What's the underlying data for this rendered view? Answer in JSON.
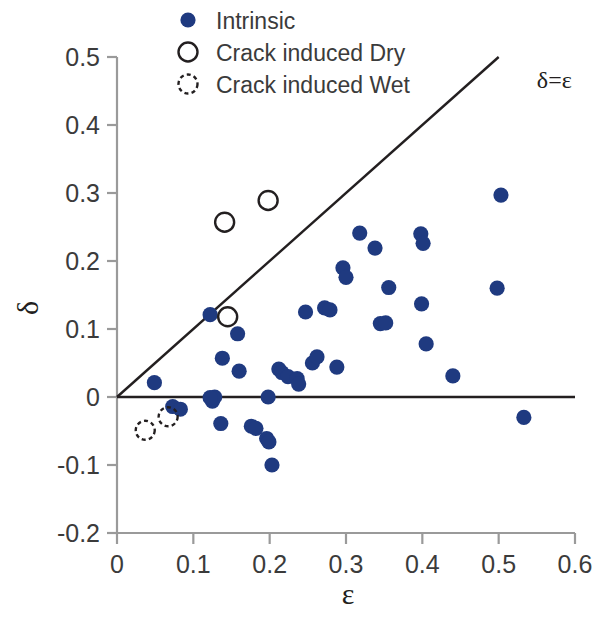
{
  "chart_data": {
    "type": "scatter",
    "title": "",
    "xlabel": "ε",
    "ylabel": "δ",
    "xlim": [
      0,
      0.6
    ],
    "ylim": [
      -0.2,
      0.5
    ],
    "xticks": [
      "0",
      "0.1",
      "0.2",
      "0.3",
      "0.4",
      "0.5",
      "0.6"
    ],
    "yticks": [
      "0.5",
      "0.4",
      "0.3",
      "0.2",
      "0.1",
      "0",
      "-0.1",
      "-0.2"
    ],
    "grid": false,
    "legend_position": "top-center",
    "annotations": [
      {
        "text": "δ=ε",
        "x": 0.55,
        "y": 0.455,
        "描述": "label for identity line"
      }
    ],
    "reference_lines": [
      {
        "name": "identity-line",
        "equation": "delta = epsilon",
        "from": [
          0.0,
          0.0
        ],
        "to": [
          0.5,
          0.5
        ]
      },
      {
        "name": "zero-line",
        "equation": "delta = 0",
        "from": [
          0.0,
          0.0
        ],
        "to": [
          0.6,
          0.0
        ]
      }
    ],
    "series": [
      {
        "name": "Intrinsic",
        "marker": "filled-circle",
        "color": "#1f3a80",
        "points": [
          [
            0.049,
            0.021
          ],
          [
            0.073,
            -0.014
          ],
          [
            0.083,
            -0.018
          ],
          [
            0.122,
            0.121
          ],
          [
            0.125,
            -0.006
          ],
          [
            0.128,
            0.0
          ],
          [
            0.122,
            -0.001
          ],
          [
            0.138,
            0.057
          ],
          [
            0.136,
            -0.039
          ],
          [
            0.158,
            0.093
          ],
          [
            0.16,
            0.038
          ],
          [
            0.176,
            -0.043
          ],
          [
            0.182,
            -0.046
          ],
          [
            0.198,
            0.0
          ],
          [
            0.196,
            -0.061
          ],
          [
            0.199,
            -0.066
          ],
          [
            0.203,
            -0.1
          ],
          [
            0.212,
            0.041
          ],
          [
            0.216,
            0.036
          ],
          [
            0.224,
            0.03
          ],
          [
            0.236,
            0.027
          ],
          [
            0.238,
            0.019
          ],
          [
            0.247,
            0.125
          ],
          [
            0.256,
            0.05
          ],
          [
            0.262,
            0.059
          ],
          [
            0.272,
            0.131
          ],
          [
            0.279,
            0.128
          ],
          [
            0.288,
            0.044
          ],
          [
            0.296,
            0.19
          ],
          [
            0.3,
            0.176
          ],
          [
            0.318,
            0.241
          ],
          [
            0.338,
            0.219
          ],
          [
            0.345,
            0.108
          ],
          [
            0.352,
            0.109
          ],
          [
            0.356,
            0.161
          ],
          [
            0.398,
            0.24
          ],
          [
            0.401,
            0.226
          ],
          [
            0.399,
            0.137
          ],
          [
            0.405,
            0.078
          ],
          [
            0.44,
            0.031
          ],
          [
            0.498,
            0.16
          ],
          [
            0.503,
            0.297
          ],
          [
            0.533,
            -0.03
          ]
        ]
      },
      {
        "name": "Crack induced Dry",
        "marker": "open-circle",
        "color": "#231f20",
        "points": [
          [
            0.141,
            0.257
          ],
          [
            0.198,
            0.289
          ],
          [
            0.145,
            0.118
          ]
        ]
      },
      {
        "name": "Crack induced Wet",
        "marker": "dashed-open-circle",
        "color": "#231f20",
        "points": [
          [
            0.037,
            -0.049
          ],
          [
            0.067,
            -0.029
          ]
        ]
      }
    ]
  },
  "legend": {
    "items": [
      {
        "label": "Intrinsic",
        "marker": "filled-circle"
      },
      {
        "label": "Crack induced Dry",
        "marker": "open-circle"
      },
      {
        "label": "Crack induced Wet",
        "marker": "dashed-open-circle"
      }
    ]
  },
  "colors": {
    "marker_fill": "#1f3a80",
    "axis": "#9a9a9a",
    "line": "#231f20",
    "text": "#3b3b3b"
  }
}
